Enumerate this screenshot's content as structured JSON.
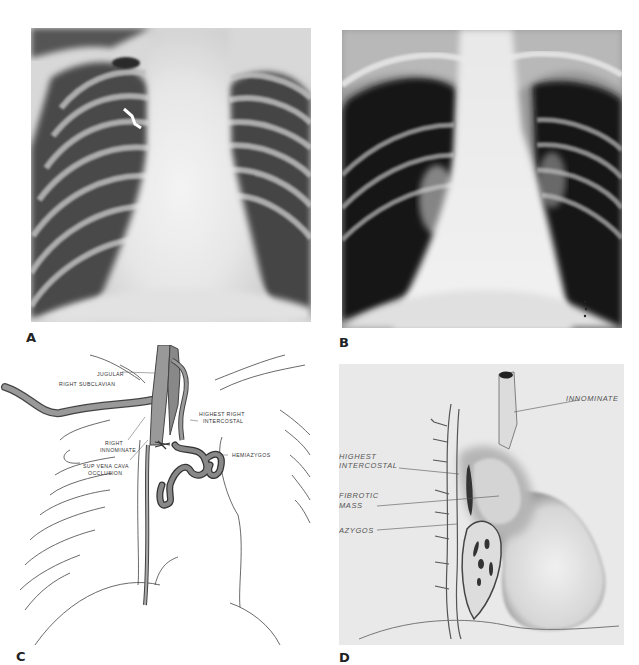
{
  "figure": {
    "panels": [
      {
        "id": "A",
        "letter": "A",
        "type": "chest-radiograph"
      },
      {
        "id": "B",
        "letter": "B",
        "type": "chest-radiograph"
      },
      {
        "id": "C",
        "letter": "C",
        "type": "line-diagram",
        "labels": {
          "jugular": "JUGULAR",
          "right_subclavian": "RIGHT SUBCLAVIAN",
          "right_innominate_1": "RIGHT",
          "right_innominate_2": "INNOMINATE",
          "highest_right_intercostal_1": "HIGHEST RIGHT",
          "highest_right_intercostal_2": "INTERCOSTAL",
          "sup_vena_cava_1": "SUP VENA CAVA",
          "sup_vena_cava_2": "OCCLUSION",
          "hemiazygos": "HEMIAZYGOS"
        }
      },
      {
        "id": "D",
        "letter": "D",
        "type": "anatomical-illustration",
        "labels": {
          "innominate": "INNOMINATE",
          "highest_intercostal_1": "HIGHEST",
          "highest_intercostal_2": "INTERCOSTAL",
          "fibrotic_mass_1": "FIBROTIC",
          "fibrotic_mass_2": "MASS",
          "azygos": "AZYGOS"
        }
      }
    ]
  }
}
